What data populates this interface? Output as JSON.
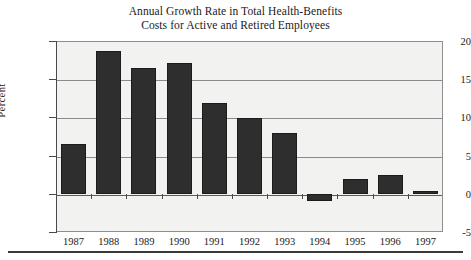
{
  "chart_data": {
    "type": "bar",
    "title": "Annual Growth Rate in Total Health-Benefits Costs for Active and Retired Employees",
    "title_lines": [
      "Annual Growth Rate in Total Health-Benefits",
      "Costs for Active and Retired Employees"
    ],
    "xlabel": "",
    "ylabel": "Percent",
    "categories": [
      "1987",
      "1988",
      "1989",
      "1990",
      "1991",
      "1992",
      "1993",
      "1994",
      "1995",
      "1996",
      "1997"
    ],
    "values": [
      6.5,
      18.7,
      16.5,
      17.1,
      11.9,
      9.9,
      8.0,
      -1.0,
      2.0,
      2.4,
      0.4
    ],
    "ylim": [
      -5,
      20
    ],
    "yticks": [
      20,
      15,
      10,
      5,
      0,
      -5
    ],
    "ytick_labels": [
      "20",
      "15",
      "10",
      "5",
      "0",
      "-5"
    ],
    "grid": true,
    "grid_axis": "y",
    "legend": false,
    "bar_color": "#2e2e2e",
    "plot_background": "#f2f2f0",
    "axis_color": "#4a4a4a"
  }
}
